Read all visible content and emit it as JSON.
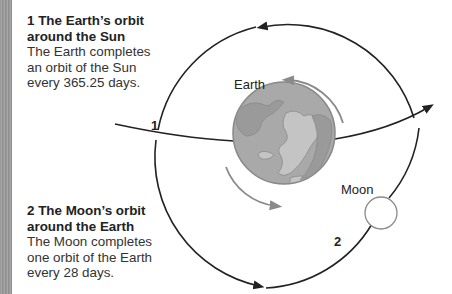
{
  "captions": [
    {
      "number": "1",
      "title": "The Earth’s orbit around the Sun",
      "body": "The Earth completes an orbit of the Sun every 365.25 days."
    },
    {
      "number": "2",
      "title": "The Moon’s orbit around the Earth",
      "body": "The Moon completes one orbit of the Earth every 28 days."
    }
  ],
  "diagram": {
    "labels": {
      "earth": "Earth",
      "moon": "Moon",
      "earth_orbit_marker": "1",
      "moon_orbit_marker": "2"
    },
    "colors": {
      "orbit_line": "#222222",
      "earth_fill": "#a9a9a9",
      "earth_land": "#c4c4c4",
      "rotation_arrow": "#8a8a8a",
      "moon_stroke": "#8a8a8a",
      "side_strip": "#9a9a9a"
    }
  }
}
